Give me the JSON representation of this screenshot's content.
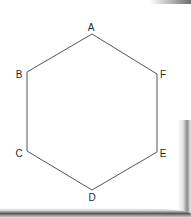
{
  "diagram": {
    "type": "regular-hexagon",
    "stroke_color": "#555555",
    "label_color": "#2a2a2a",
    "vertices": [
      {
        "label": "A",
        "x": 92,
        "y": 34,
        "lx": 91,
        "ly": 31
      },
      {
        "label": "B",
        "x": 27,
        "y": 72,
        "lx": 19,
        "ly": 78
      },
      {
        "label": "C",
        "x": 27,
        "y": 151,
        "lx": 19,
        "ly": 157
      },
      {
        "label": "D",
        "x": 92,
        "y": 190,
        "lx": 92,
        "ly": 201
      },
      {
        "label": "E",
        "x": 157,
        "y": 152,
        "lx": 163,
        "ly": 157
      },
      {
        "label": "F",
        "x": 157,
        "y": 74,
        "lx": 163,
        "ly": 78
      }
    ]
  }
}
